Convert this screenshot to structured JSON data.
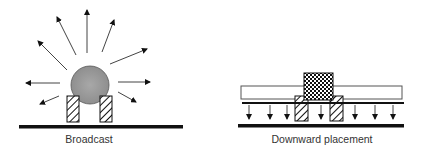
{
  "figure": {
    "panels": [
      {
        "id": "broadcast",
        "caption": "Broadcast",
        "elements": [
          "sphere",
          "hatched-pads",
          "substrate-bar",
          "radiating-arrows"
        ],
        "arrow_count": 9
      },
      {
        "id": "downward",
        "caption": "Downward placement",
        "elements": [
          "checkered-chip",
          "carrier-plate",
          "hatched-pads",
          "thin-bar",
          "substrate-bar",
          "downward-arrows"
        ],
        "arrow_count": 7
      }
    ],
    "colors": {
      "ink": "#111111",
      "sphere_fill": "#9a9a9a",
      "background": "#ffffff"
    }
  }
}
